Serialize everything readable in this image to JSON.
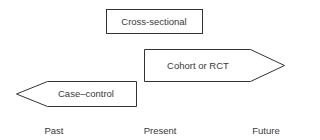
{
  "diagram": {
    "type": "study-design-timeline",
    "shapes": {
      "cross_sectional": {
        "label": "Cross-sectional",
        "shape": "rectangle"
      },
      "cohort": {
        "label": "Cohort or RCT",
        "shape": "arrow-right"
      },
      "case_control": {
        "label": "Case–control",
        "shape": "arrow-left"
      }
    },
    "timeline": [
      "Past",
      "Present",
      "Future"
    ],
    "colors": {
      "stroke": "#333333",
      "fill": "#ffffff",
      "text": "#3a3a3a"
    }
  }
}
